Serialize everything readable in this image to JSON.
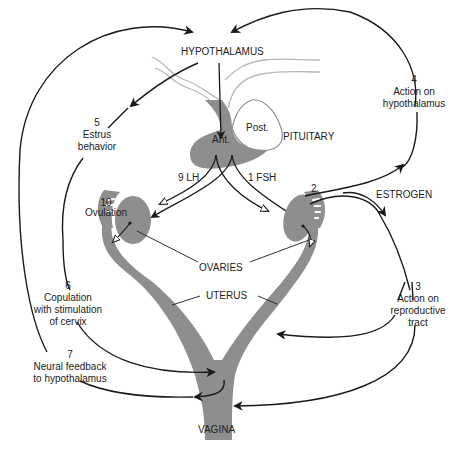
{
  "colors": {
    "tissue": "#8e8e8e",
    "line": "#1a1a1a",
    "duct": "#b8b8b8",
    "text": "#222222"
  },
  "labels": {
    "hypothalamus": "HYPOTHALAMUS",
    "anterior": "Ant.",
    "posterior": "Post.",
    "pituitary": "PITUITARY",
    "lh": "9  LH",
    "fsh": "1  FSH",
    "estrogen": "ESTROGEN",
    "ovaries": "OVARIES",
    "uterus": "UTERUS",
    "vagina": "VAGINA"
  },
  "steps": [
    {
      "number": "1",
      "text": "FSH"
    },
    {
      "number": "2",
      "text": ""
    },
    {
      "number": "3",
      "text": "Action on\nreproductive\ntract"
    },
    {
      "number": "4",
      "text": "Action on\nhypothalamus"
    },
    {
      "number": "5",
      "text": "Estrus\nbehavior"
    },
    {
      "number": "6",
      "text": "Copulation\nwith stimulation\nof cervix"
    },
    {
      "number": "7",
      "text": "Neural feedback\nto hypothalamus"
    },
    {
      "number": "9",
      "text": "LH"
    },
    {
      "number": "10",
      "text": "Ovulation"
    }
  ]
}
